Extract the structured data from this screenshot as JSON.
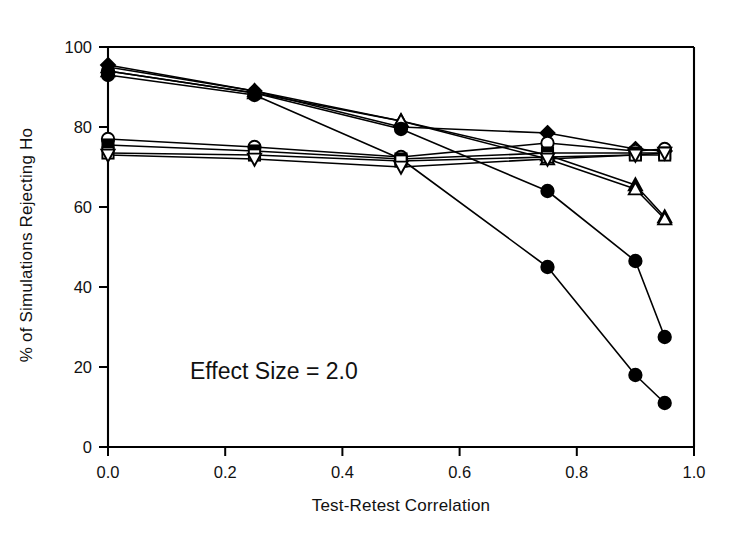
{
  "chart_data": {
    "type": "line",
    "title": "",
    "xlabel": "Test-Retest Correlation",
    "ylabel": "% of Simulations Rejecting Ho",
    "xlim": [
      0.0,
      1.0
    ],
    "ylim": [
      0,
      100
    ],
    "xticks": [
      "0.0",
      "0.2",
      "0.4",
      "0.6",
      "0.8",
      "1.0"
    ],
    "xtick_values": [
      0.0,
      0.2,
      0.4,
      0.6,
      0.8,
      1.0
    ],
    "yticks": [
      "0",
      "20",
      "40",
      "60",
      "80",
      "100"
    ],
    "ytick_values": [
      0,
      20,
      40,
      60,
      80,
      100
    ],
    "grid": false,
    "legend": "none",
    "annotations": [
      {
        "text": "Effect Size = 2.0",
        "x": 0.14,
        "y": 17
      }
    ],
    "x": [
      0.0,
      0.25,
      0.5,
      0.75,
      0.9,
      0.95
    ],
    "series": [
      {
        "name": "series-1-filled-diamond-flat",
        "marker": "filled-diamond",
        "fill": "#000000",
        "values": [
          95.5,
          89.0,
          80.0,
          78.5,
          74.5,
          74.0
        ]
      },
      {
        "name": "series-2-filled-triangle-decline",
        "marker": "filled-triangle",
        "fill": "#000000",
        "values": [
          95.0,
          89.0,
          81.5,
          73.0,
          65.5,
          57.5
        ]
      },
      {
        "name": "series-3-open-triangle-decline",
        "marker": "open-triangle",
        "fill": "#ffffff",
        "values": [
          94.0,
          88.5,
          81.5,
          72.0,
          64.5,
          57.0
        ]
      },
      {
        "name": "series-4-filled-circle-steep",
        "marker": "filled-circle",
        "fill": "#000000",
        "values": [
          94.0,
          88.5,
          79.5,
          64.0,
          46.5,
          27.5
        ]
      },
      {
        "name": "series-5-filled-circle-steepest",
        "marker": "filled-circle",
        "fill": "#000000",
        "values": [
          93.0,
          88.0,
          72.0,
          45.0,
          18.0,
          11.0
        ]
      },
      {
        "name": "series-6-open-circle-flat",
        "marker": "open-circle",
        "fill": "#ffffff",
        "values": [
          77.0,
          75.0,
          72.5,
          76.0,
          74.0,
          74.5
        ]
      },
      {
        "name": "series-7-filled-square-flat",
        "marker": "filled-square",
        "fill": "#000000",
        "values": [
          75.5,
          74.0,
          72.0,
          73.5,
          73.5,
          73.5
        ]
      },
      {
        "name": "series-8-open-square-flat",
        "marker": "open-square",
        "fill": "#ffffff",
        "values": [
          73.5,
          73.0,
          71.5,
          72.5,
          73.0,
          73.0
        ]
      },
      {
        "name": "series-9-open-inverted-triangle-flat",
        "marker": "open-inverted-triangle",
        "fill": "#ffffff",
        "values": [
          73.0,
          72.0,
          70.0,
          72.0,
          73.0,
          73.5
        ]
      }
    ]
  },
  "figure": {
    "background_color": "#ffffff",
    "line_color": "#000000",
    "axis_color": "#000000"
  }
}
